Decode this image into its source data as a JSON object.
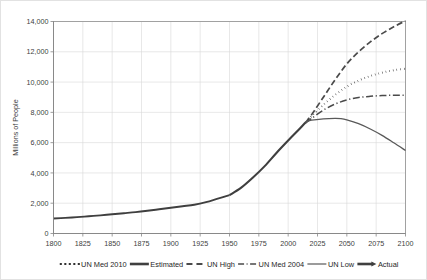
{
  "chart_data": {
    "type": "line",
    "title": "",
    "subtitle": "",
    "xlabel": "",
    "ylabel": "Millions of People",
    "xlim": [
      1800,
      2100
    ],
    "ylim": [
      0,
      14000
    ],
    "grid": true,
    "legend_position": "bottom",
    "x_ticks": [
      1800,
      1825,
      1850,
      1875,
      1900,
      1925,
      1950,
      1975,
      2000,
      2025,
      2050,
      2075,
      2100
    ],
    "x_tick_labels": [
      "1800",
      "1825",
      "1850",
      "1875",
      "1900",
      "1925",
      "1950",
      "1975",
      "2000",
      "2025",
      "2050",
      "2075",
      "2100"
    ],
    "y_ticks": [
      0,
      2000,
      4000,
      6000,
      8000,
      10000,
      12000,
      14000
    ],
    "y_tick_labels": [
      "0",
      "2,000",
      "4,000",
      "6,000",
      "8,000",
      "10,000",
      "12,000",
      "14,000"
    ],
    "series": [
      {
        "name": "Estimated",
        "style": "solid-thick",
        "color": "#3f3f3f",
        "width": 1.9,
        "dash": "",
        "x": [
          1800,
          1810,
          1820,
          1830,
          1840,
          1850,
          1860,
          1870,
          1880,
          1890,
          1900,
          1910,
          1920,
          1930,
          1940,
          1950
        ],
        "y": [
          990,
          1030,
          1080,
          1140,
          1200,
          1270,
          1340,
          1410,
          1500,
          1600,
          1700,
          1800,
          1900,
          2070,
          2300,
          2530
        ]
      },
      {
        "name": "Actual",
        "style": "solid-thick",
        "color": "#3f3f3f",
        "width": 2.1,
        "dash": "",
        "x": [
          1950,
          1960,
          1970,
          1980,
          1990,
          2000,
          2010,
          2015
        ],
        "y": [
          2530,
          3030,
          3700,
          4450,
          5320,
          6140,
          6930,
          7350
        ]
      },
      {
        "name": "UN High",
        "style": "dashed",
        "color": "#4a4a4a",
        "width": 1.7,
        "dash": "6,3",
        "x": [
          2015,
          2020,
          2030,
          2040,
          2050,
          2060,
          2070,
          2080,
          2090,
          2100
        ],
        "y": [
          7350,
          7850,
          9000,
          10150,
          11200,
          12000,
          12650,
          13200,
          13650,
          14050
        ]
      },
      {
        "name": "UN Med 2010",
        "style": "dotted",
        "color": "#2b2b2b",
        "width": 2.0,
        "dash": "0.5,3.2",
        "x": [
          2015,
          2020,
          2030,
          2040,
          2050,
          2060,
          2070,
          2080,
          2090,
          2100
        ],
        "y": [
          7350,
          7750,
          8500,
          9150,
          9700,
          10100,
          10400,
          10620,
          10780,
          10880
        ]
      },
      {
        "name": "UN Med 2004",
        "style": "dash-dot",
        "color": "#4a4a4a",
        "width": 1.5,
        "dash": "7,2.6,1.2,2.6",
        "x": [
          2015,
          2020,
          2030,
          2040,
          2050,
          2060,
          2070,
          2080,
          2090,
          2100
        ],
        "y": [
          7300,
          7600,
          8150,
          8550,
          8820,
          8980,
          9060,
          9110,
          9130,
          9120
        ]
      },
      {
        "name": "UN Low",
        "style": "solid",
        "color": "#595959",
        "width": 1.3,
        "dash": "",
        "x": [
          2015,
          2020,
          2030,
          2040,
          2045,
          2050,
          2060,
          2070,
          2080,
          2090,
          2100
        ],
        "y": [
          7350,
          7480,
          7570,
          7600,
          7580,
          7500,
          7250,
          6900,
          6480,
          5990,
          5480
        ]
      }
    ],
    "legend": [
      {
        "label": "UN Med 2010",
        "marker": "dotted"
      },
      {
        "label": "Estimated",
        "marker": "solid-thick"
      },
      {
        "label": "UN High",
        "marker": "dashed"
      },
      {
        "label": "UN Med 2004",
        "marker": "dash-dot"
      },
      {
        "label": "UN Low",
        "marker": "solid"
      },
      {
        "label": "Actual",
        "marker": "solid-thick-arrow"
      }
    ]
  },
  "colors": {
    "background": "#ffffff",
    "grid": "#d9d9d9",
    "axis": "#868686",
    "text": "#404040",
    "series_dark": "#3f3f3f"
  }
}
